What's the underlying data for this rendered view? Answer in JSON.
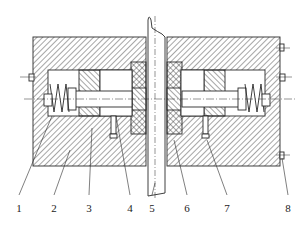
{
  "figure": {
    "type": "mechanical cross-section drawing",
    "colors": {
      "line": "#2a2a2a",
      "hatch": "#3a3a3a",
      "background": "#ffffff"
    }
  },
  "labels": [
    {
      "id": "1",
      "text": "1",
      "x": 19,
      "y": 203
    },
    {
      "id": "2",
      "text": "2",
      "x": 54,
      "y": 203
    },
    {
      "id": "3",
      "text": "3",
      "x": 89,
      "y": 203
    },
    {
      "id": "4",
      "text": "4",
      "x": 130,
      "y": 203
    },
    {
      "id": "5",
      "text": "5",
      "x": 152,
      "y": 203
    },
    {
      "id": "6",
      "text": "6",
      "x": 187,
      "y": 203
    },
    {
      "id": "7",
      "text": "7",
      "x": 227,
      "y": 203
    },
    {
      "id": "8",
      "text": "8",
      "x": 288,
      "y": 203
    }
  ]
}
